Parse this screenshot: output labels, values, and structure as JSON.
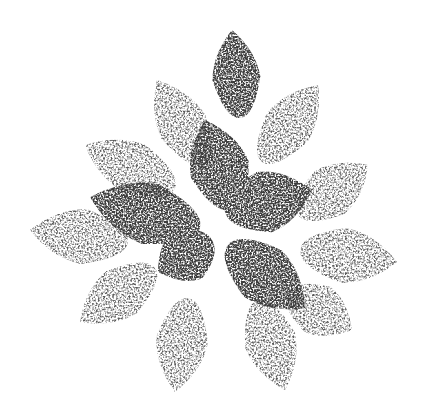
{
  "image": {
    "subject": "stippled poinsettia flower",
    "background_color": "#ffffff",
    "ink_color": "#3c3c3c",
    "light_ink_color": "#5a5a5a",
    "leaves": [
      {
        "name": "top",
        "tip": [
          232,
          30
        ],
        "base": [
          240,
          118
        ],
        "width": 48,
        "tone": "dark"
      },
      {
        "name": "upper-left",
        "tip": [
          157,
          80
        ],
        "base": [
          205,
          165
        ],
        "width": 50,
        "tone": "light"
      },
      {
        "name": "upper-right",
        "tip": [
          318,
          85
        ],
        "base": [
          262,
          162
        ],
        "width": 50,
        "tone": "light"
      },
      {
        "name": "left",
        "tip": [
          85,
          145
        ],
        "base": [
          175,
          188
        ],
        "width": 52,
        "tone": "light"
      },
      {
        "name": "right",
        "tip": [
          368,
          165
        ],
        "base": [
          298,
          215
        ],
        "width": 52,
        "tone": "light"
      },
      {
        "name": "far-left",
        "tip": [
          30,
          230
        ],
        "base": [
          128,
          242
        ],
        "width": 55,
        "tone": "light"
      },
      {
        "name": "far-right",
        "tip": [
          397,
          262
        ],
        "base": [
          300,
          250
        ],
        "width": 55,
        "tone": "light"
      },
      {
        "name": "lower-left",
        "tip": [
          80,
          322
        ],
        "base": [
          155,
          268
        ],
        "width": 52,
        "tone": "light"
      },
      {
        "name": "bottom-left",
        "tip": [
          175,
          392
        ],
        "base": [
          188,
          298
        ],
        "width": 52,
        "tone": "light"
      },
      {
        "name": "bottom-right",
        "tip": [
          285,
          390
        ],
        "base": [
          258,
          300
        ],
        "width": 52,
        "tone": "light"
      },
      {
        "name": "lower-right",
        "tip": [
          352,
          330
        ],
        "base": [
          288,
          292
        ],
        "width": 52,
        "tone": "light"
      },
      {
        "name": "inner-upper",
        "tip": [
          205,
          120
        ],
        "base": [
          232,
          210
        ],
        "width": 60,
        "tone": "dark"
      },
      {
        "name": "inner-right",
        "tip": [
          312,
          190
        ],
        "base": [
          225,
          212
        ],
        "width": 62,
        "tone": "dark"
      },
      {
        "name": "inner-left",
        "tip": [
          90,
          197
        ],
        "base": [
          200,
          228
        ],
        "width": 62,
        "tone": "dark"
      },
      {
        "name": "inner-lower-left",
        "tip": [
          158,
          272
        ],
        "base": [
          212,
          240
        ],
        "width": 56,
        "tone": "dark"
      },
      {
        "name": "inner-lower-right",
        "tip": [
          305,
          308
        ],
        "base": [
          228,
          245
        ],
        "width": 60,
        "tone": "dark"
      }
    ]
  }
}
